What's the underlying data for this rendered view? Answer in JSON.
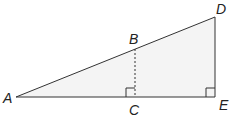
{
  "diagram": {
    "type": "geometry-similar-triangles",
    "colors": {
      "fill": "#f4f4f4",
      "stroke": "#333333",
      "label": "#222222"
    },
    "points": {
      "A": {
        "label": "A",
        "x": 16,
        "y": 97
      },
      "B": {
        "label": "B",
        "x": 135,
        "y": 49
      },
      "C": {
        "label": "C",
        "x": 135,
        "y": 97
      },
      "D": {
        "label": "D",
        "x": 215,
        "y": 17
      },
      "E": {
        "label": "E",
        "x": 215,
        "y": 97
      }
    },
    "segments": [
      {
        "from": "A",
        "to": "D",
        "style": "solid"
      },
      {
        "from": "A",
        "to": "E",
        "style": "solid"
      },
      {
        "from": "D",
        "to": "E",
        "style": "solid"
      },
      {
        "from": "B",
        "to": "C",
        "style": "dashed"
      }
    ],
    "right_angles": [
      "C",
      "E"
    ]
  }
}
